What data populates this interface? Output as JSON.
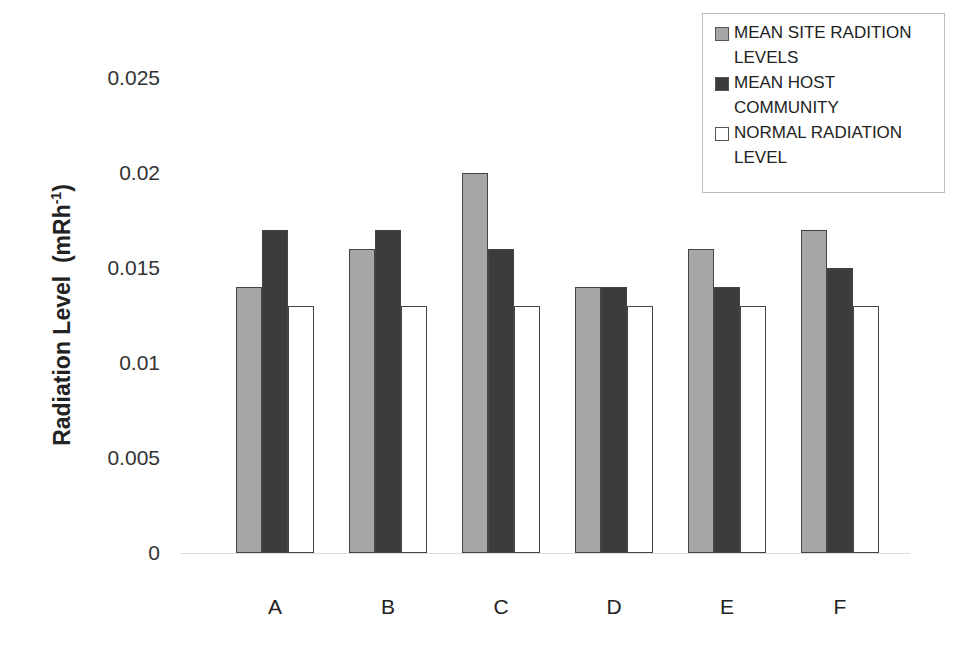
{
  "chart_data": {
    "type": "bar",
    "title": "",
    "xlabel": "",
    "ylabel": "Radiation Level (mRh-1)",
    "ylabel_main": "Radiation Level",
    "ylabel_unit": "(mRh",
    "ylabel_sup": "-1",
    "ylabel_close": ")",
    "ylim": [
      0,
      0.025
    ],
    "yticks": [
      "0",
      "0.005",
      "0.01",
      "0.015",
      "0.02",
      "0.025"
    ],
    "grid": false,
    "legend_position": "top-right",
    "categories": [
      "A",
      "B",
      "C",
      "D",
      "E",
      "F"
    ],
    "series": [
      {
        "name": "MEAN SITE RADITION LEVELS",
        "color": "#a6a6a6",
        "values": [
          0.014,
          0.016,
          0.02,
          0.014,
          0.016,
          0.017
        ]
      },
      {
        "name": "MEAN HOST COMMUNITY",
        "color": "#3c3c3c",
        "values": [
          0.017,
          0.017,
          0.016,
          0.014,
          0.014,
          0.015
        ]
      },
      {
        "name": "NORMAL RADIATION LEVEL",
        "color": "#ffffff",
        "values": [
          0.013,
          0.013,
          0.013,
          0.013,
          0.013,
          0.013
        ]
      }
    ]
  },
  "legend": {
    "items": [
      {
        "line1": "MEAN SITE RADITION",
        "line2": "LEVELS"
      },
      {
        "line1": "MEAN HOST",
        "line2": "COMMUNITY"
      },
      {
        "line1": "NORMAL RADIATION",
        "line2": "LEVEL"
      }
    ]
  }
}
